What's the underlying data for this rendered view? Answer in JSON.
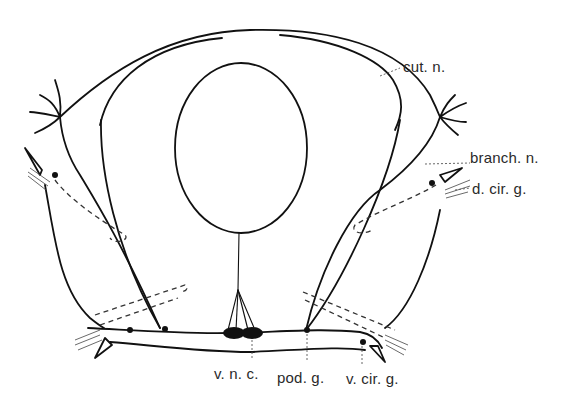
{
  "figure": {
    "labels": {
      "cut_n": "cut. n.",
      "branch_n": "branch. n.",
      "d_cir_g": "d. cir. g.",
      "v_n_c": "v. n. c.",
      "pod_g": "pod. g.",
      "v_cir_g": "v. cir. g."
    },
    "colors": {
      "line": "#111111",
      "text": "#2a2a2a",
      "background": "#ffffff"
    }
  }
}
